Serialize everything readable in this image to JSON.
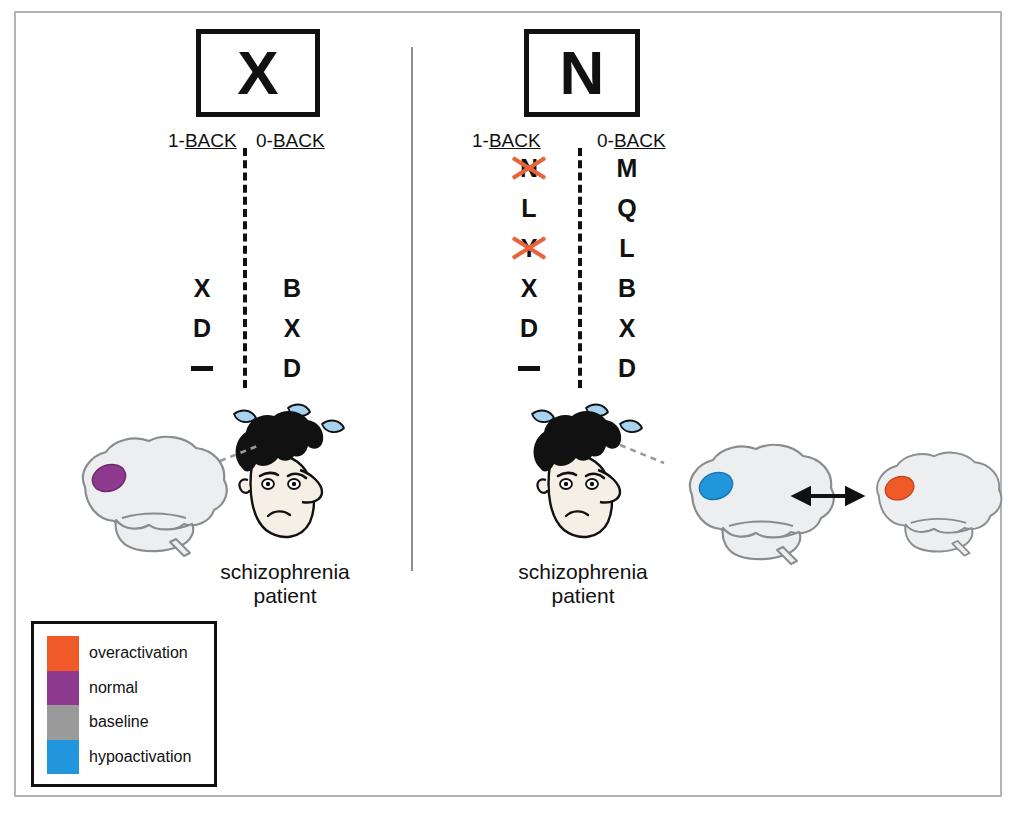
{
  "figure": {
    "panels": [
      {
        "id": "left",
        "stimulus_letter": "X",
        "columns": [
          {
            "label_prefix": "1-",
            "label_underlined": "BACK",
            "letters": [
              "",
              "",
              "",
              "X",
              "D",
              "—"
            ],
            "struck": [
              false,
              false,
              false,
              false,
              false,
              false
            ]
          },
          {
            "label_prefix": "0-",
            "label_underlined": "BACK",
            "letters": [
              "",
              "",
              "",
              "B",
              "X",
              "D"
            ],
            "struck": [
              false,
              false,
              false,
              false,
              false,
              false
            ]
          }
        ],
        "caption_line1": "schizophrenia",
        "caption_line2": "patient",
        "brains": [
          {
            "activation": "normal",
            "color": "#8e3a8e",
            "position": "left-of-head"
          }
        ]
      },
      {
        "id": "right",
        "stimulus_letter": "N",
        "columns": [
          {
            "label_prefix": "1-",
            "label_underlined": "BACK",
            "letters": [
              "N",
              "L",
              "Y",
              "X",
              "D",
              "—"
            ],
            "struck": [
              true,
              false,
              true,
              false,
              false,
              false
            ]
          },
          {
            "label_prefix": "0-",
            "label_underlined": "BACK",
            "letters": [
              "M",
              "Q",
              "L",
              "B",
              "X",
              "D"
            ],
            "struck": [
              false,
              false,
              false,
              false,
              false,
              false
            ]
          }
        ],
        "caption_line1": "schizophrenia",
        "caption_line2": "patient",
        "brains": [
          {
            "activation": "hypoactivation",
            "color": "#2196dd",
            "position": "right-of-head"
          },
          {
            "activation": "overactivation",
            "color": "#ef5a28",
            "position": "far-right"
          }
        ]
      }
    ],
    "legend": {
      "items": [
        {
          "label": "overactivation",
          "color": "#ef5a28"
        },
        {
          "label": "normal",
          "color": "#8e3a8e"
        },
        {
          "label": "baseline",
          "color": "#9a9a9a"
        },
        {
          "label": "hypoactivation",
          "color": "#2196dd"
        }
      ]
    },
    "colors": {
      "strike_mark": "#e8623a",
      "brain_fill": "#eceef0",
      "brain_outline": "#8a8d90",
      "skin": "#f6efe6",
      "hair": "#111111",
      "sweat_fill": "#a8d3f0",
      "frame": "#b4b4b4",
      "ink": "#111111"
    }
  }
}
